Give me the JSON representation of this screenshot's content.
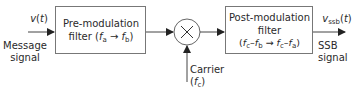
{
  "diagram": {
    "input": {
      "symbol": "v(t)",
      "label_line1": "Message",
      "label_line2": "signal"
    },
    "pre_filter": {
      "line1": "Pre-modulation",
      "line2": "filter (f_a → f_b)"
    },
    "multiplier": {
      "symbol": "×"
    },
    "carrier": {
      "label_line1": "Carrier",
      "label_line2": "(f_c)"
    },
    "post_filter": {
      "line1": "Post-modulation",
      "line2": "filter",
      "line3": "(f_c–f_b → f_c–f_a)"
    },
    "output": {
      "symbol": "v_ssb(t)",
      "label_line1": "SSB",
      "label_line2": "signal"
    },
    "colors": {
      "stroke": "#555555",
      "text": "#2a2a2a"
    }
  }
}
